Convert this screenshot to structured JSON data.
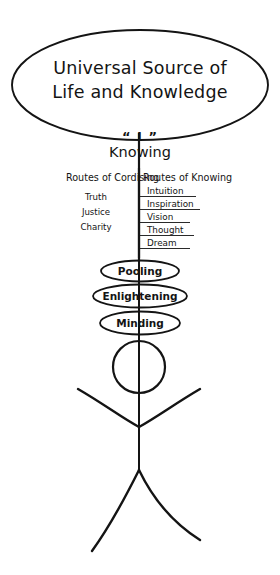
{
  "canvas": {
    "width": 280,
    "height": 575,
    "background": "#ffffff",
    "ink": "#141414"
  },
  "source": {
    "name": "universal-source-ellipse",
    "line1": "Universal Source of",
    "line2": "Life and Knowledge",
    "ellipse": {
      "cx": 140,
      "cy": 85,
      "rx": 128,
      "ry": 55
    }
  },
  "axis": {
    "name": "central-vertical-axis",
    "i_marker": "“ I ”",
    "knowing_label": "Knowing",
    "x": 139,
    "top": 133,
    "bottom": 470
  },
  "columns": {
    "left": {
      "header": "Routes of Cordising",
      "items": [
        "Truth",
        "Justice",
        "Charity"
      ]
    },
    "right": {
      "header": "Routes of Knowing",
      "items": [
        "Intuition",
        "Inspiration",
        "Vision",
        "Thought",
        "Dream"
      ]
    }
  },
  "ovals": [
    {
      "label": "Pooling",
      "cx": 140,
      "cy": 271,
      "rx": 39,
      "ry": 10.5
    },
    {
      "label": "Enlightening",
      "cx": 140,
      "cy": 296,
      "rx": 47,
      "ry": 11.5
    },
    {
      "label": "Minding",
      "cx": 140,
      "cy": 323,
      "rx": 40,
      "ry": 11.5
    }
  ],
  "figure": {
    "name": "stick-figure",
    "head": {
      "cx": 139,
      "cy": 367,
      "r": 26
    },
    "body_top": 333,
    "body_bottom": 470,
    "shoulder_y": 425,
    "hip_y": 470
  }
}
